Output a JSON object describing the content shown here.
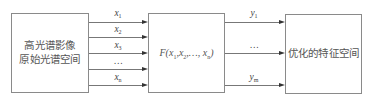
{
  "diagram": {
    "source_box": {
      "line1": "高光谱影像",
      "line2": "原始光谱空间"
    },
    "function_box": {
      "label": "F(x1,x2,…,xn)",
      "f": "F(",
      "parts": [
        "x",
        "1",
        ",x",
        "2",
        ",…, x",
        "n",
        ")"
      ]
    },
    "target_box": {
      "label": "优化的特征空间"
    },
    "inputs": [
      {
        "var": "x",
        "sub": "1"
      },
      {
        "var": "x",
        "sub": "2"
      },
      {
        "var": "x",
        "sub": "3"
      },
      {
        "var": "…",
        "sub": ""
      },
      {
        "var": "x",
        "sub": "n"
      }
    ],
    "outputs": [
      {
        "var": "y",
        "sub": "1"
      },
      {
        "var": "…",
        "sub": ""
      },
      {
        "var": "y",
        "sub": "m"
      }
    ],
    "colors": {
      "box_border": "#8a8a8a",
      "line": "#777777",
      "arrow": "#333333",
      "text": "#555555"
    }
  }
}
